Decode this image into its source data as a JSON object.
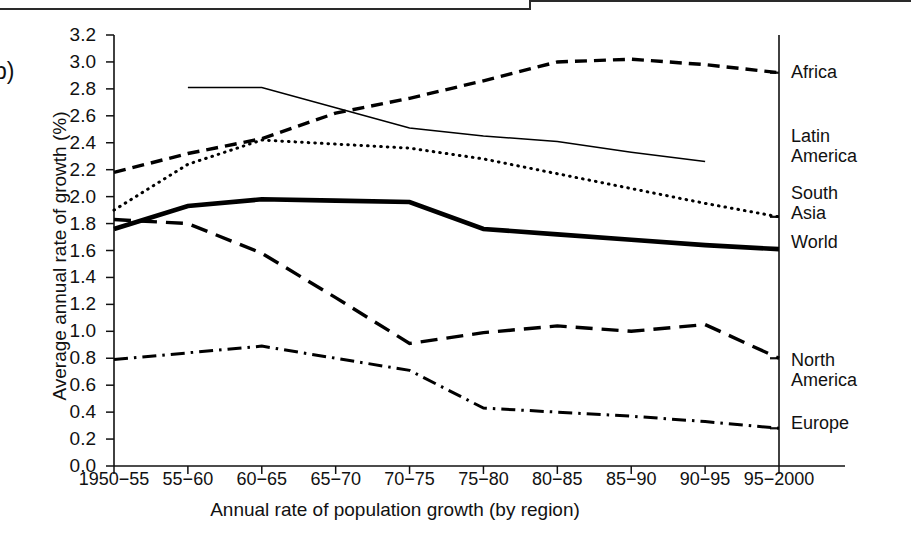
{
  "figure": {
    "panel_label": "b)"
  },
  "axes": {
    "y_title": "Average annual rate of growth (%)",
    "x_title": "Annual rate of population growth (by region)",
    "y_ticks": [
      "0.0",
      "0.2",
      "0.4",
      "0.6",
      "0.8",
      "1.0",
      "1.2",
      "1.4",
      "1.6",
      "1.8",
      "2.0",
      "2.2",
      "2.4",
      "2.6",
      "2.8",
      "3.0",
      "3.2"
    ],
    "x_ticks": [
      "1950−55",
      "55−60",
      "60−65",
      "65−70",
      "70−75",
      "75−80",
      "80−85",
      "85−90",
      "90−95",
      "95−2000"
    ]
  },
  "legend": [
    {
      "name": "Africa",
      "style": "dashed"
    },
    {
      "name": "Latin\nAmerica",
      "line1": "Latin",
      "line2": "America",
      "style": "thin-solid"
    },
    {
      "name": "South\nAsia",
      "line1": "South",
      "line2": "Asia",
      "style": "dotted"
    },
    {
      "name": "World",
      "style": "thick-solid"
    },
    {
      "name": "North\nAmerica",
      "line1": "North",
      "line2": "America",
      "style": "long-dash"
    },
    {
      "name": "Europe",
      "style": "dash-dot"
    }
  ],
  "chart_data": {
    "type": "line",
    "title": "",
    "xlabel": "Annual rate of population growth (by region)",
    "ylabel": "Average annual rate of growth (%)",
    "categories": [
      "1950−55",
      "55−60",
      "60−65",
      "65−70",
      "70−75",
      "75−80",
      "80−85",
      "85−90",
      "90−95",
      "95−2000"
    ],
    "ylim": [
      0.0,
      3.2
    ],
    "ytick_step": 0.2,
    "grid": false,
    "legend_position": "right-of-axis",
    "series": [
      {
        "name": "Africa",
        "style": "dashed",
        "color": "#000000",
        "values": [
          2.18,
          2.32,
          2.43,
          2.62,
          2.73,
          2.86,
          3.0,
          3.02,
          2.98,
          2.92
        ]
      },
      {
        "name": "Latin America",
        "style": "thin-solid",
        "color": "#000000",
        "values": [
          null,
          2.81,
          2.81,
          2.66,
          2.51,
          2.45,
          2.41,
          2.33,
          2.26,
          null
        ]
      },
      {
        "name": "South Asia",
        "style": "dotted",
        "color": "#000000",
        "values": [
          1.9,
          2.24,
          2.42,
          2.39,
          2.36,
          2.28,
          2.17,
          2.06,
          1.95,
          1.85
        ]
      },
      {
        "name": "World",
        "style": "thick-solid",
        "color": "#000000",
        "values": [
          1.76,
          1.93,
          1.98,
          1.97,
          1.96,
          1.76,
          1.72,
          1.68,
          1.64,
          1.61
        ]
      },
      {
        "name": "North America",
        "style": "long-dash",
        "color": "#000000",
        "values": [
          1.83,
          1.8,
          1.58,
          1.25,
          0.91,
          0.99,
          1.04,
          1.0,
          1.05,
          0.8
        ]
      },
      {
        "name": "Europe",
        "style": "dash-dot",
        "color": "#000000",
        "values": [
          0.79,
          0.84,
          0.89,
          0.8,
          0.71,
          0.43,
          0.4,
          0.37,
          0.33,
          0.28
        ]
      }
    ]
  }
}
